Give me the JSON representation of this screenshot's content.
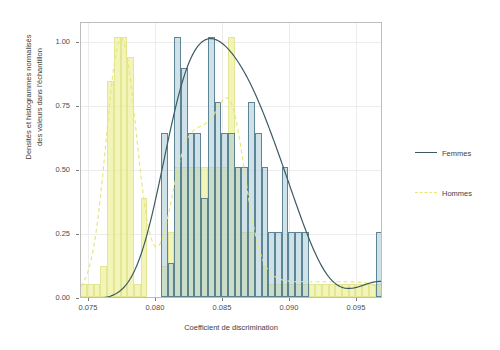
{
  "figure": {
    "xlabel": "Coefficient de discrimination",
    "ylabel_line1": "Densités et histogrammes normalisés",
    "ylabel_line2": "des valeurs dans l'échantillon"
  },
  "axes": {
    "x_ticks": [
      "0.075",
      "0.080",
      "0.085",
      "0.090",
      "0.095"
    ],
    "y_ticks": [
      "1.00",
      "0.75",
      "0.50",
      "0.25",
      "0.00"
    ]
  },
  "legend": {
    "items": [
      {
        "label": "Femmes",
        "color": "#3d5a63",
        "style": "solid"
      },
      {
        "label": "Hommes",
        "color": "#e6e87a",
        "style": "dashed"
      }
    ]
  },
  "colors": {
    "femmes_fill": "#a3c7d6",
    "femmes_line": "#3d5a63",
    "hommes_fill": "#ebee8c",
    "hommes_line": "#e6e87a",
    "overlap": "#aec49a",
    "panel_border": "#bdbdbd",
    "grid": "#ececec"
  },
  "chart_data": {
    "type": "bar",
    "title": "",
    "xlabel": "Coefficient de discrimination",
    "ylabel": "Densités et histogrammes normalisés des valeurs dans l'échantillon",
    "xlim": [
      0.0753,
      0.0978
    ],
    "ylim": [
      0.0,
      1.06
    ],
    "grid": true,
    "legend_position": "right",
    "bin_width": 0.0005,
    "series": [
      {
        "name": "Hommes",
        "type": "histogram",
        "fill": "#ebee8c",
        "line": "#e6e87a",
        "linestyle": "dashed",
        "bins_x": [
          0.0755,
          0.076,
          0.0765,
          0.077,
          0.0775,
          0.078,
          0.0785,
          0.079,
          0.0795,
          0.08,
          0.0805,
          0.081,
          0.0815,
          0.082,
          0.0825,
          0.083,
          0.0835,
          0.084,
          0.0845,
          0.085,
          0.0855,
          0.086,
          0.0865,
          0.087,
          0.0875,
          0.088,
          0.0885,
          0.089,
          0.0895,
          0.09,
          0.0905,
          0.091,
          0.0915,
          0.092,
          0.0925,
          0.093,
          0.0935,
          0.094,
          0.0945,
          0.095,
          0.0955,
          0.096,
          0.0965,
          0.097,
          0.0975
        ],
        "values": [
          0.05,
          0.05,
          0.05,
          0.12,
          0.83,
          1.0,
          1.0,
          0.92,
          0.05,
          0.38,
          0.0,
          0.0,
          0.12,
          0.25,
          0.5,
          0.5,
          0.5,
          0.5,
          0.5,
          0.5,
          0.5,
          0.5,
          1.0,
          0.5,
          0.25,
          0.25,
          0.0,
          0.12,
          0.05,
          0.05,
          0.05,
          0.05,
          0.05,
          0.05,
          0.05,
          0.05,
          0.05,
          0.05,
          0.05,
          0.05,
          0.05,
          0.05,
          0.05,
          0.05,
          0.05
        ],
        "density_curve": {
          "mode_x": 0.078,
          "mode_y": 1.0,
          "secondary_mode_x": 0.0865,
          "secondary_mode_y": 0.87,
          "trough_x": 0.083,
          "trough_y": 0.31
        }
      },
      {
        "name": "Femmes",
        "type": "histogram",
        "fill": "#a3c7d6",
        "line": "#3d5a63",
        "linestyle": "solid",
        "bins_x": [
          0.0815,
          0.082,
          0.0825,
          0.083,
          0.0835,
          0.084,
          0.0845,
          0.085,
          0.0855,
          0.086,
          0.0865,
          0.087,
          0.0875,
          0.088,
          0.0885,
          0.089,
          0.0895,
          0.09,
          0.0905,
          0.091,
          0.0915,
          0.092,
          0.0925,
          0.093,
          0.0975,
          0.098
        ],
        "values": [
          0.63,
          0.13,
          1.0,
          0.88,
          0.63,
          0.63,
          0.38,
          1.0,
          0.75,
          0.63,
          0.63,
          0.5,
          0.5,
          0.75,
          0.63,
          0.5,
          0.25,
          0.25,
          0.5,
          0.25,
          0.25,
          0.25,
          0.0,
          0.0,
          0.25,
          0.13
        ],
        "density_curve": {
          "mode_x": 0.0862,
          "mode_y": 1.0,
          "secondary_mode_x": 0.0968,
          "secondary_mode_y": 0.14,
          "trough_x": 0.0948,
          "trough_y": 0.07
        }
      }
    ]
  }
}
